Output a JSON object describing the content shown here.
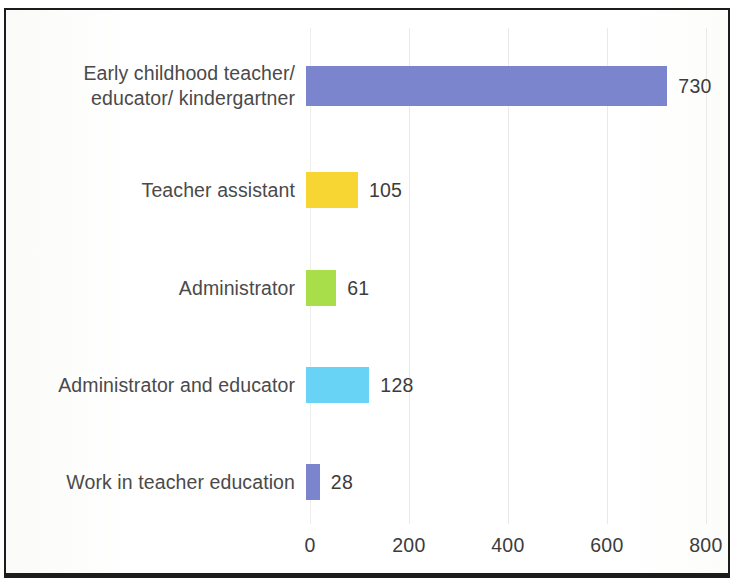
{
  "chart_data": {
    "type": "bar",
    "orientation": "horizontal",
    "title": "",
    "xlabel": "",
    "ylabel": "",
    "xlim": [
      0,
      850
    ],
    "xticks": [
      0,
      200,
      400,
      600,
      800
    ],
    "xtick_labels": [
      "0",
      "200",
      "400",
      "600",
      "800"
    ],
    "grid": true,
    "legend": "none",
    "categories": [
      "Early childhood teacher/\neducator/ kindergartner",
      "Teacher assistant",
      "Administrator",
      "Administrator and educator",
      "Work in teacher education"
    ],
    "values": [
      730,
      105,
      61,
      128,
      28
    ],
    "value_labels": [
      "730",
      "105",
      "61",
      "128",
      "28"
    ],
    "colors": [
      "#7b85ce",
      "#f7d533",
      "#a8de4a",
      "#68d3f5",
      "#7b85ce"
    ]
  },
  "bars": [
    {
      "label": "Early childhood teacher/\neducator/ kindergartner",
      "value_label": "730",
      "color": "#7b85ce"
    },
    {
      "label": "Teacher assistant",
      "value_label": "105",
      "color": "#f7d533"
    },
    {
      "label": "Administrator",
      "value_label": "61",
      "color": "#a8de4a"
    },
    {
      "label": "Administrator and educator",
      "value_label": "128",
      "color": "#68d3f5"
    },
    {
      "label": "Work in teacher education",
      "value_label": "28",
      "color": "#7b85ce"
    }
  ],
  "axis": {
    "ticks": [
      "0",
      "200",
      "400",
      "600",
      "800"
    ]
  }
}
